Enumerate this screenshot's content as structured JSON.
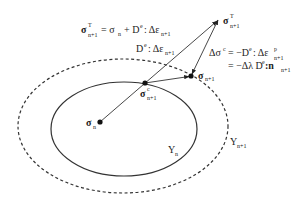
{
  "diagram": {
    "type": "return-mapping-stress-update",
    "points": {
      "sigma_n": {
        "label": "σ",
        "sub": "n",
        "x": 100,
        "y": 122
      },
      "sigma_c": {
        "label": "σ",
        "sup": "c",
        "sub": "n+1",
        "x": 145,
        "y": 83
      },
      "sigma_np1": {
        "label": "σ",
        "sub": "n+1",
        "x": 191,
        "y": 76
      },
      "sigma_T": {
        "label": "σ",
        "sup": "T",
        "sub": "n+1",
        "x": 218,
        "y": 20
      }
    },
    "surfaces": {
      "Y_n": {
        "label": "Y",
        "sub": "n",
        "style": "solid"
      },
      "Y_np1": {
        "label": "Y",
        "sub": "n+1",
        "style": "dashed"
      }
    },
    "equations": {
      "trial": {
        "lhs": "σ",
        "lhs_sup": "T",
        "lhs_sub": "n+1",
        "rhs": "= σ",
        "rhs_sub": "n",
        "rhs2": "+ D",
        "rhs2_sup": "e",
        "rhs3": ": Δε",
        "rhs3_sub": "n+1"
      },
      "elastic_increment": {
        "text": "D",
        "sup": "e",
        "text2": ": Δε",
        "sub": "n+1"
      },
      "correction_line1": {
        "text": "Δσ",
        "sup": "c",
        "text2": "= −D",
        "sup2": "e",
        "text3": ": Δε",
        "sup3": "p",
        "sub3": "n+1"
      },
      "correction_line2": {
        "text": "= −Δλ D",
        "sup": "e",
        "text2": ":n",
        "sub": "n+1"
      }
    }
  }
}
